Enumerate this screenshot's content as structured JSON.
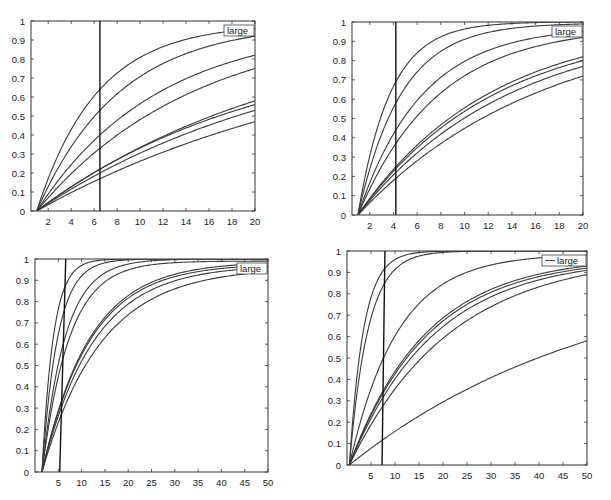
{
  "chart_data": [
    {
      "type": "line",
      "title": "",
      "xlabel": "",
      "ylabel": "",
      "xlim": [
        0.5,
        20
      ],
      "ylim": [
        0,
        1
      ],
      "xticks": [
        "2",
        "4",
        "6",
        "8",
        "10",
        "12",
        "14",
        "16",
        "18",
        "20"
      ],
      "xtick_values": [
        2,
        4,
        6,
        8,
        10,
        12,
        14,
        16,
        18,
        20
      ],
      "yticks": [
        "0",
        "0.1",
        "0.2",
        "0.3",
        "0.4",
        "0.5",
        "0.6",
        "0.7",
        "0.8",
        "0.9",
        "1"
      ],
      "ytick_values": [
        0,
        0.1,
        0.2,
        0.3,
        0.4,
        0.5,
        0.6,
        0.7,
        0.8,
        0.9,
        1
      ],
      "grid": false,
      "legend": {
        "entries": [
          "large"
        ],
        "placement": "top-right"
      },
      "vline": {
        "x_bottom": 6.5,
        "x_top": 6.5
      },
      "x_start": 1,
      "series": [
        {
          "name": "curve-1",
          "at_vline": 0.64,
          "at_end": 0.96
        },
        {
          "name": "curve-2",
          "at_vline": 0.53,
          "at_end": 0.92
        },
        {
          "name": "curve-3",
          "at_vline": 0.4,
          "at_end": 0.82
        },
        {
          "name": "curve-4",
          "at_vline": 0.33,
          "at_end": 0.75
        },
        {
          "name": "curve-5",
          "at_vline": 0.22,
          "at_end": 0.58
        },
        {
          "name": "curve-6",
          "at_vline": 0.22,
          "at_end": 0.56
        },
        {
          "name": "curve-7",
          "at_vline": 0.2,
          "at_end": 0.53
        },
        {
          "name": "curve-8",
          "at_vline": 0.17,
          "at_end": 0.47
        }
      ]
    },
    {
      "type": "line",
      "title": "",
      "xlabel": "",
      "ylabel": "",
      "xlim": [
        0.5,
        20
      ],
      "ylim": [
        0,
        1
      ],
      "xticks": [
        "2",
        "4",
        "6",
        "8",
        "10",
        "12",
        "14",
        "16",
        "18",
        "20"
      ],
      "xtick_values": [
        2,
        4,
        6,
        8,
        10,
        12,
        14,
        16,
        18,
        20
      ],
      "yticks": [
        "0",
        "0.1",
        "0.2",
        "0.3",
        "0.4",
        "0.5",
        "0.6",
        "0.7",
        "0.8",
        "0.9",
        "1"
      ],
      "ytick_values": [
        0,
        0.1,
        0.2,
        0.3,
        0.4,
        0.5,
        0.6,
        0.7,
        0.8,
        0.9,
        1
      ],
      "grid": false,
      "legend": {
        "entries": [
          "large"
        ],
        "placement": "top-right"
      },
      "vline": {
        "x_bottom": 4.2,
        "x_top": 4.2
      },
      "x_start": 1,
      "series": [
        {
          "name": "curve-1",
          "at_vline": 0.69,
          "at_end": 1.0
        },
        {
          "name": "curve-2",
          "at_vline": 0.58,
          "at_end": 0.99
        },
        {
          "name": "curve-3",
          "at_vline": 0.44,
          "at_end": 0.95
        },
        {
          "name": "curve-4",
          "at_vline": 0.37,
          "at_end": 0.92
        },
        {
          "name": "curve-5",
          "at_vline": 0.25,
          "at_end": 0.82
        },
        {
          "name": "curve-6",
          "at_vline": 0.24,
          "at_end": 0.8
        },
        {
          "name": "curve-7",
          "at_vline": 0.22,
          "at_end": 0.77
        },
        {
          "name": "curve-8",
          "at_vline": 0.19,
          "at_end": 0.72
        }
      ]
    },
    {
      "type": "line",
      "title": "",
      "xlabel": "",
      "ylabel": "",
      "xlim": [
        0,
        50
      ],
      "ylim": [
        0,
        1
      ],
      "xticks": [
        "5",
        "10",
        "15",
        "20",
        "25",
        "30",
        "35",
        "40",
        "45",
        "50"
      ],
      "xtick_values": [
        5,
        10,
        15,
        20,
        25,
        30,
        35,
        40,
        45,
        50
      ],
      "yticks": [
        "0",
        "0.1",
        "0.2",
        "0.3",
        "0.4",
        "0.5",
        "0.6",
        "0.7",
        "0.8",
        "0.9",
        "1"
      ],
      "ytick_values": [
        0,
        0.1,
        0.2,
        0.3,
        0.4,
        0.5,
        0.6,
        0.7,
        0.8,
        0.9,
        1
      ],
      "grid": false,
      "legend": {
        "entries": [
          "large"
        ],
        "placement": "top-right"
      },
      "vline": {
        "x_bottom": 5.3,
        "x_top": 6.6
      },
      "x_start": 1.5,
      "series": [
        {
          "name": "curve-1",
          "at_x10": 0.97,
          "at_end": 1.0
        },
        {
          "name": "curve-2",
          "at_x10": 0.92,
          "at_end": 1.0
        },
        {
          "name": "curve-3",
          "at_x10": 0.82,
          "at_end": 1.0
        },
        {
          "name": "curve-4",
          "at_x10": 0.76,
          "at_end": 0.99
        },
        {
          "name": "curve-5",
          "at_x10": 0.56,
          "at_end": 0.98
        },
        {
          "name": "curve-6",
          "at_x10": 0.55,
          "at_end": 0.97
        },
        {
          "name": "curve-7",
          "at_x10": 0.52,
          "at_end": 0.96
        },
        {
          "name": "curve-8",
          "at_x10": 0.47,
          "at_end": 0.94
        }
      ]
    },
    {
      "type": "line",
      "title": "",
      "xlabel": "",
      "ylabel": "",
      "xlim": [
        0,
        50
      ],
      "ylim": [
        0,
        1
      ],
      "xticks": [
        "5",
        "10",
        "15",
        "20",
        "25",
        "30",
        "35",
        "40",
        "45",
        "50"
      ],
      "xtick_values": [
        5,
        10,
        15,
        20,
        25,
        30,
        35,
        40,
        45,
        50
      ],
      "yticks": [
        "0",
        "0.1",
        "0.2",
        "0.3",
        "0.4",
        "0.5",
        "0.6",
        "0.7",
        "0.8",
        "0.9",
        "1"
      ],
      "ytick_values": [
        0,
        0.1,
        0.2,
        0.3,
        0.4,
        0.5,
        0.6,
        0.7,
        0.8,
        0.9,
        1
      ],
      "grid": false,
      "legend": {
        "entries": [
          "large"
        ],
        "placement": "top-right"
      },
      "vline": {
        "x_bottom": 7.3,
        "x_top": 7.9
      },
      "x_start": 0.5,
      "series": [
        {
          "name": "curve-1",
          "at_vline": 0.91,
          "at_end": 1.0
        },
        {
          "name": "curve-2",
          "at_vline": 0.84,
          "at_end": 1.0
        },
        {
          "name": "curve-3",
          "at_vline": 0.5,
          "at_end": 0.98
        },
        {
          "name": "curve-4",
          "at_vline": 0.35,
          "at_end": 0.93
        },
        {
          "name": "curve-5",
          "at_vline": 0.34,
          "at_end": 0.92
        },
        {
          "name": "curve-6",
          "at_vline": 0.32,
          "at_end": 0.91
        },
        {
          "name": "curve-7",
          "at_vline": 0.28,
          "at_end": 0.89
        },
        {
          "name": "curve-8",
          "at_vline": 0.12,
          "at_end": 0.58
        }
      ]
    }
  ]
}
